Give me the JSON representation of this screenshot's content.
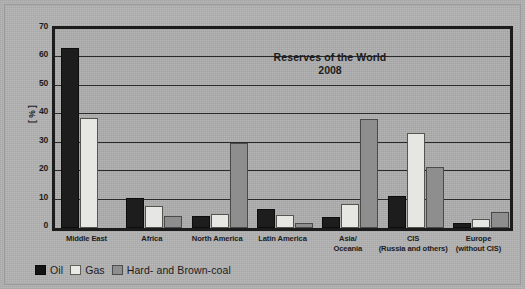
{
  "chart_data": {
    "type": "bar",
    "title": "Reserves of the World",
    "subtitle": "2008",
    "xlabel": "",
    "ylabel": "[ % ]",
    "ylim": [
      0,
      70
    ],
    "ytick_step": 10,
    "yticks": [
      "0",
      "10",
      "20",
      "30",
      "40",
      "50",
      "60",
      "70"
    ],
    "grid": true,
    "legend_position": "bottom-left",
    "categories": [
      "Middle East",
      "Africa",
      "North America",
      "Latin America",
      "Asia/\nOceania",
      "CIS\n(Russia and others)",
      "Europe\n(without CIS)"
    ],
    "series": [
      {
        "name": "Oil",
        "color": "#1d1d1d",
        "values": [
          63.4,
          10.7,
          4.3,
          6.8,
          4.0,
          11.3,
          1.8
        ]
      },
      {
        "name": "Gas",
        "color": "#e6e6e2",
        "values": [
          38.6,
          7.9,
          4.8,
          4.5,
          8.5,
          33.5,
          3.0
        ]
      },
      {
        "name": "Hard- and Brown-coal",
        "color": "#8e8e8e",
        "values": [
          0,
          4.1,
          30.0,
          1.8,
          38.5,
          21.5,
          5.8
        ]
      }
    ]
  },
  "legend": {
    "items": [
      {
        "label": "Oil",
        "swatch": "oil"
      },
      {
        "label": "Gas",
        "swatch": "gas"
      },
      {
        "label": "Hard- and Brown-coal",
        "swatch": "coal"
      }
    ]
  }
}
